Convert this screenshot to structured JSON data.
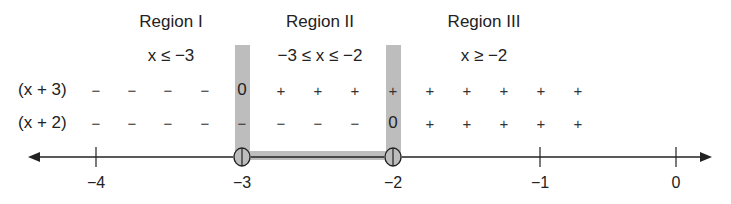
{
  "regions": [
    {
      "title": "Region I",
      "condition": "x ≤ −3",
      "cx": 171
    },
    {
      "title": "Region II",
      "condition": "−3 ≤ x ≤ −2",
      "cx": 320
    },
    {
      "title": "Region III",
      "condition": "x ≥ −2",
      "cx": 484
    }
  ],
  "rows": [
    {
      "label": "(x + 3)",
      "signs": [
        "−",
        "−",
        "−",
        "−",
        "0",
        "+",
        "+",
        "+",
        "+",
        "+",
        "+",
        "+",
        "+",
        "+"
      ]
    },
    {
      "label": "(x + 2)",
      "signs": [
        "−",
        "−",
        "−",
        "−",
        "−",
        "−",
        "−",
        "−",
        "0",
        "+",
        "+",
        "+",
        "+",
        "+"
      ]
    }
  ],
  "sign_columns_x": [
    96,
    132,
    168,
    205,
    242,
    281,
    318,
    355,
    393,
    430,
    467,
    504,
    541,
    578
  ],
  "axis": {
    "ticks": [
      {
        "value": -4,
        "label": "−4",
        "x": 96
      },
      {
        "value": -3,
        "label": "−3",
        "x": 242
      },
      {
        "value": -2,
        "label": "−2",
        "x": 393
      },
      {
        "value": -1,
        "label": "−1",
        "x": 540
      },
      {
        "value": 0,
        "label": "0",
        "x": 676
      }
    ],
    "critical_points": [
      -3,
      -2
    ],
    "shaded_interval": [
      -3,
      -2
    ]
  },
  "colors": {
    "shade": "#bdbdbd",
    "line": "#222222"
  }
}
